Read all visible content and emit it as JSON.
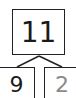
{
  "number_bond": {
    "whole": "11",
    "parts": [
      "9",
      "2"
    ]
  },
  "colors": {
    "line": "#222222",
    "given_part": "#1a1a1a",
    "answer_part": "#8a8a8a"
  }
}
